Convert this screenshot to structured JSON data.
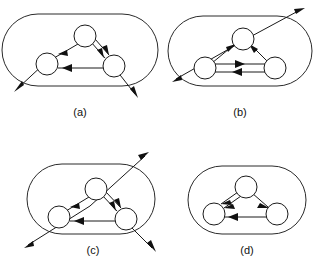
{
  "figure": {
    "type": "diagram",
    "background_color": "#ffffff",
    "line_color": "#1a1a1a",
    "node_fill": "#ffffff",
    "panels": [
      {
        "id": "a",
        "label": "(a)",
        "boundary": "rounded-rectangle",
        "nodes": [
          "top",
          "left",
          "right"
        ],
        "internal_edges": [
          {
            "from": "top",
            "to": "left",
            "style": "single",
            "arrow": "to-left"
          },
          {
            "from": "top",
            "to": "right",
            "style": "double",
            "arrow": "both-to-right"
          },
          {
            "from": "left",
            "to": "right",
            "style": "single",
            "arrow": "to-left"
          }
        ],
        "external_edges": [
          {
            "from": "left",
            "direction": "down-left",
            "arrowhead": "outside"
          },
          {
            "from": "right",
            "direction": "down-right",
            "arrowhead": "outside"
          }
        ]
      },
      {
        "id": "b",
        "label": "(b)",
        "boundary": "rounded-rectangle",
        "nodes": [
          "top",
          "left",
          "right"
        ],
        "internal_edges": [
          {
            "from": "left",
            "to": "top",
            "style": "single",
            "arrow": "to-top"
          },
          {
            "from": "right",
            "to": "top",
            "style": "single",
            "arrow": "to-top"
          },
          {
            "from": "left",
            "to": "right",
            "style": "double",
            "arrow": "opposite"
          }
        ],
        "external_edges": [
          {
            "from": "top",
            "direction": "up-right",
            "arrowhead": "outside"
          },
          {
            "from": "left",
            "direction": "down-left",
            "arrowhead": "outside"
          }
        ]
      },
      {
        "id": "c",
        "label": "(c)",
        "boundary": "rounded-rectangle",
        "nodes": [
          "top",
          "left",
          "right"
        ],
        "internal_edges": [
          {
            "from": "top",
            "to": "left",
            "style": "single",
            "arrow": "to-left"
          },
          {
            "from": "top",
            "to": "right",
            "style": "double",
            "arrow": "both-to-right"
          },
          {
            "from": "left",
            "to": "right",
            "style": "single",
            "arrow": "to-left"
          }
        ],
        "external_edges": [
          {
            "from": "top",
            "direction": "up-right",
            "arrowhead": "outside"
          },
          {
            "from": "left",
            "direction": "down-left",
            "arrowhead": "outside"
          },
          {
            "from": "right",
            "direction": "down-right",
            "arrowhead": "outside"
          }
        ]
      },
      {
        "id": "d",
        "label": "(d)",
        "boundary": "rounded-rectangle",
        "nodes": [
          "top",
          "left",
          "right"
        ],
        "internal_edges": [
          {
            "from": "top",
            "to": "left",
            "style": "double",
            "arrow": "both-to-left"
          },
          {
            "from": "top",
            "to": "right",
            "style": "single",
            "arrow": "to-right"
          },
          {
            "from": "right",
            "to": "left",
            "style": "single",
            "arrow": "to-left"
          }
        ],
        "external_edges": []
      }
    ]
  }
}
